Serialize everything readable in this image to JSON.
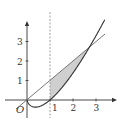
{
  "diagram": {
    "title": "",
    "curve": "y = x ln x",
    "line": "y = x",
    "vertical_dashed": "x = 1",
    "shaded_region": {
      "from_x": 1,
      "to_x": 2.718,
      "between": [
        "y = x",
        "y = x ln x"
      ],
      "fill": "#cfcfcf"
    },
    "origin_label": "O",
    "x_ticks": [
      {
        "value": 1,
        "label": "1"
      },
      {
        "value": 2,
        "label": "2"
      },
      {
        "value": 3,
        "label": "3"
      }
    ],
    "y_ticks": [
      {
        "value": 1,
        "label": "1"
      },
      {
        "value": 2,
        "label": "2"
      },
      {
        "value": 3,
        "label": "3"
      }
    ],
    "colors": {
      "stroke": "#333333",
      "line": "#666666",
      "shade": "#cfcfcf",
      "dash": "#888888"
    }
  }
}
